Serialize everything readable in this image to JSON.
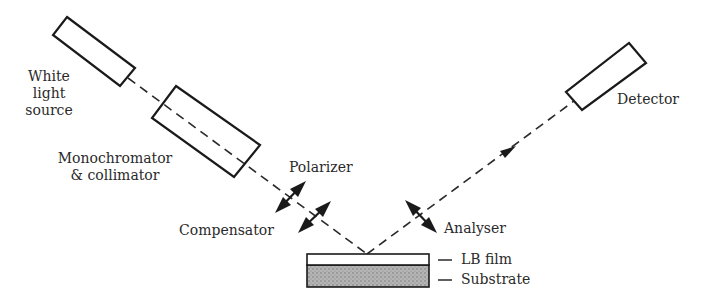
{
  "diagram": {
    "components": {
      "light_source": {
        "label_lines": [
          "White",
          "light",
          "source"
        ]
      },
      "monochromator": {
        "label_lines": [
          "Monochromator",
          "& collimator"
        ]
      },
      "polarizer": {
        "label": "Polarizer"
      },
      "compensator": {
        "label": "Compensator"
      },
      "analyser": {
        "label": "Analyser"
      },
      "detector": {
        "label": "Detector"
      },
      "lb_film": {
        "label": "LB film"
      },
      "substrate": {
        "label": "Substrate"
      }
    },
    "colors": {
      "line": "#1a1a1a",
      "text": "#2a2a2a",
      "substrate_fill": "#a8a8a8",
      "film_fill": "#ffffff"
    }
  }
}
